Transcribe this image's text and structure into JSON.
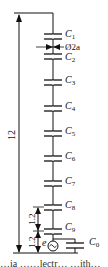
{
  "diagram": {
    "capacitors": [
      {
        "name": "C",
        "sub": "1",
        "y": 36
      },
      {
        "name": "C",
        "sub": "2",
        "y": 56
      },
      {
        "name": "C",
        "sub": "3",
        "y": 82
      },
      {
        "name": "C",
        "sub": "4",
        "y": 108
      },
      {
        "name": "C",
        "sub": "5",
        "y": 133
      },
      {
        "name": "C",
        "sub": "6",
        "y": 158
      },
      {
        "name": "C",
        "sub": "7",
        "y": 183
      },
      {
        "name": "C",
        "sub": "8",
        "y": 207
      },
      {
        "name": "C",
        "sub": "9",
        "y": 231
      }
    ],
    "ground_capacitor": {
      "name": "C",
      "sub": "0"
    },
    "diameter_label": "Ø2a",
    "source_label": "e",
    "dimensions": {
      "total_height": "12",
      "segment_upper": "1.2",
      "segment_lower": "1.2"
    },
    "caption_partial": "…ia ……lectr… …ith…"
  }
}
